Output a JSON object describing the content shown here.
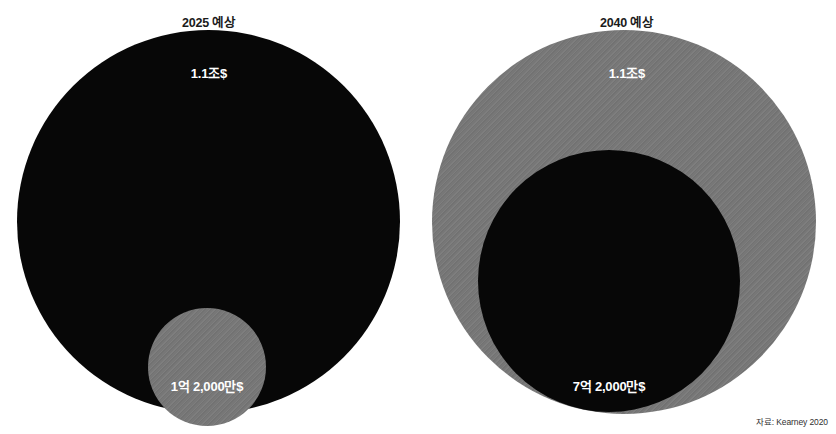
{
  "source_note": "자료: Kearney 2020",
  "colors": {
    "total_bubble": "#070707",
    "sub_bubble_gray": "#777777",
    "background": "#ffffff",
    "label_text": "#ffffff",
    "title_text": "#1b1b1b"
  },
  "panels": [
    {
      "id": "2025",
      "title": "2025 예상",
      "total": {
        "label": "1.1조$",
        "value": 1.1,
        "unit": "조$",
        "fill": "dark"
      },
      "sub": {
        "label": "1억 2,000만$",
        "value": 1.2,
        "unit": "억$",
        "fill": "gray"
      }
    },
    {
      "id": "2040",
      "title": "2040 예상",
      "total": {
        "label": "1.1조$",
        "value": 1.1,
        "unit": "조$",
        "fill": "gray"
      },
      "sub": {
        "label": "7억 2,000만$",
        "value": 7.2,
        "unit": "억$",
        "fill": "dark"
      }
    }
  ],
  "chart_data": {
    "type": "bubble",
    "title": "",
    "xlabel": "",
    "ylabel": "",
    "legend": [],
    "grid": false,
    "categories": [
      "2025 예상",
      "2040 예상"
    ],
    "series": [
      {
        "name": "총 시장 규모",
        "labels": [
          "1.1조$",
          "1.1조$"
        ],
        "values": [
          1.1,
          1.1
        ],
        "unit": "조$"
      },
      {
        "name": "부분 규모",
        "labels": [
          "1억 2,000만$",
          "7억 2,000만$"
        ],
        "values": [
          0.00012,
          0.00072
        ],
        "unit": "조$"
      }
    ],
    "annotations": [
      "자료: Kearney 2020"
    ]
  }
}
